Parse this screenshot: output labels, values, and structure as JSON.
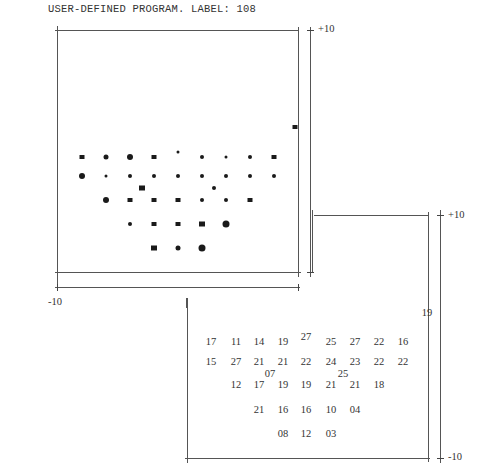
{
  "header": {
    "title": "USER-DEFINED PROGRAM. LABEL: 108"
  },
  "axis_labels": {
    "top_plot_plus": "+10",
    "top_plot_minus": "-10",
    "bottom_plot_plus": "+10",
    "bottom_plot_minus": "-10"
  },
  "greyscale_plot": {
    "points": [
      {
        "x": 82,
        "y": 157,
        "s": 5,
        "shape": "sq"
      },
      {
        "x": 106,
        "y": 157,
        "s": 5,
        "shape": "round"
      },
      {
        "x": 130,
        "y": 157,
        "s": 6,
        "shape": "round"
      },
      {
        "x": 154,
        "y": 157,
        "s": 5,
        "shape": "sq"
      },
      {
        "x": 178,
        "y": 152,
        "s": 3,
        "shape": "round"
      },
      {
        "x": 202,
        "y": 157,
        "s": 4,
        "shape": "round"
      },
      {
        "x": 226,
        "y": 157,
        "s": 3,
        "shape": "round"
      },
      {
        "x": 250,
        "y": 157,
        "s": 4,
        "shape": "round"
      },
      {
        "x": 274,
        "y": 157,
        "s": 5,
        "shape": "sq"
      },
      {
        "x": 82,
        "y": 176,
        "s": 6,
        "shape": "round"
      },
      {
        "x": 106,
        "y": 176,
        "s": 3,
        "shape": "round"
      },
      {
        "x": 130,
        "y": 176,
        "s": 4,
        "shape": "round"
      },
      {
        "x": 154,
        "y": 176,
        "s": 4,
        "shape": "round"
      },
      {
        "x": 178,
        "y": 176,
        "s": 4,
        "shape": "round"
      },
      {
        "x": 202,
        "y": 176,
        "s": 4,
        "shape": "round"
      },
      {
        "x": 226,
        "y": 176,
        "s": 4,
        "shape": "round"
      },
      {
        "x": 250,
        "y": 176,
        "s": 4,
        "shape": "round"
      },
      {
        "x": 274,
        "y": 176,
        "s": 4,
        "shape": "round"
      },
      {
        "x": 142,
        "y": 188,
        "s": 6,
        "shape": "sq"
      },
      {
        "x": 214,
        "y": 188,
        "s": 4,
        "shape": "round"
      },
      {
        "x": 106,
        "y": 200,
        "s": 6,
        "shape": "round"
      },
      {
        "x": 130,
        "y": 200,
        "s": 5,
        "shape": "sq"
      },
      {
        "x": 154,
        "y": 200,
        "s": 5,
        "shape": "sq"
      },
      {
        "x": 178,
        "y": 200,
        "s": 5,
        "shape": "sq"
      },
      {
        "x": 202,
        "y": 200,
        "s": 4,
        "shape": "round"
      },
      {
        "x": 226,
        "y": 200,
        "s": 4,
        "shape": "round"
      },
      {
        "x": 250,
        "y": 200,
        "s": 5,
        "shape": "sq"
      },
      {
        "x": 130,
        "y": 224,
        "s": 4,
        "shape": "round"
      },
      {
        "x": 154,
        "y": 224,
        "s": 5,
        "shape": "sq"
      },
      {
        "x": 178,
        "y": 224,
        "s": 5,
        "shape": "sq"
      },
      {
        "x": 202,
        "y": 224,
        "s": 6,
        "shape": "sq"
      },
      {
        "x": 226,
        "y": 224,
        "s": 7,
        "shape": "round"
      },
      {
        "x": 154,
        "y": 248,
        "s": 6,
        "shape": "sq"
      },
      {
        "x": 178,
        "y": 248,
        "s": 5,
        "shape": "round"
      },
      {
        "x": 202,
        "y": 248,
        "s": 7,
        "shape": "round"
      },
      {
        "x": 295,
        "y": 127,
        "s": 5,
        "shape": "sq"
      }
    ]
  },
  "numeric_plot": {
    "values": [
      {
        "v": "17",
        "x": 211,
        "y": 341
      },
      {
        "v": "11",
        "x": 236,
        "y": 341
      },
      {
        "v": "14",
        "x": 259,
        "y": 341
      },
      {
        "v": "19",
        "x": 283,
        "y": 341
      },
      {
        "v": "27",
        "x": 306,
        "y": 336
      },
      {
        "v": "25",
        "x": 331,
        "y": 341
      },
      {
        "v": "27",
        "x": 355,
        "y": 341
      },
      {
        "v": "22",
        "x": 379,
        "y": 341
      },
      {
        "v": "16",
        "x": 403,
        "y": 341
      },
      {
        "v": "15",
        "x": 211,
        "y": 361
      },
      {
        "v": "27",
        "x": 236,
        "y": 361
      },
      {
        "v": "21",
        "x": 259,
        "y": 361
      },
      {
        "v": "21",
        "x": 283,
        "y": 361
      },
      {
        "v": "22",
        "x": 306,
        "y": 361
      },
      {
        "v": "24",
        "x": 331,
        "y": 361
      },
      {
        "v": "23",
        "x": 355,
        "y": 361
      },
      {
        "v": "22",
        "x": 379,
        "y": 361
      },
      {
        "v": "22",
        "x": 403,
        "y": 361
      },
      {
        "v": "07",
        "x": 270,
        "y": 373
      },
      {
        "v": "25",
        "x": 343,
        "y": 373
      },
      {
        "v": "12",
        "x": 236,
        "y": 384
      },
      {
        "v": "17",
        "x": 259,
        "y": 384
      },
      {
        "v": "19",
        "x": 283,
        "y": 384
      },
      {
        "v": "19",
        "x": 306,
        "y": 384
      },
      {
        "v": "21",
        "x": 331,
        "y": 384
      },
      {
        "v": "21",
        "x": 355,
        "y": 384
      },
      {
        "v": "18",
        "x": 379,
        "y": 384
      },
      {
        "v": "21",
        "x": 259,
        "y": 409
      },
      {
        "v": "16",
        "x": 283,
        "y": 409
      },
      {
        "v": "16",
        "x": 306,
        "y": 409
      },
      {
        "v": "10",
        "x": 331,
        "y": 409
      },
      {
        "v": "04",
        "x": 355,
        "y": 409
      },
      {
        "v": "08",
        "x": 283,
        "y": 433
      },
      {
        "v": "12",
        "x": 306,
        "y": 433
      },
      {
        "v": "03",
        "x": 331,
        "y": 433
      },
      {
        "v": "19",
        "x": 427,
        "y": 312
      }
    ]
  }
}
